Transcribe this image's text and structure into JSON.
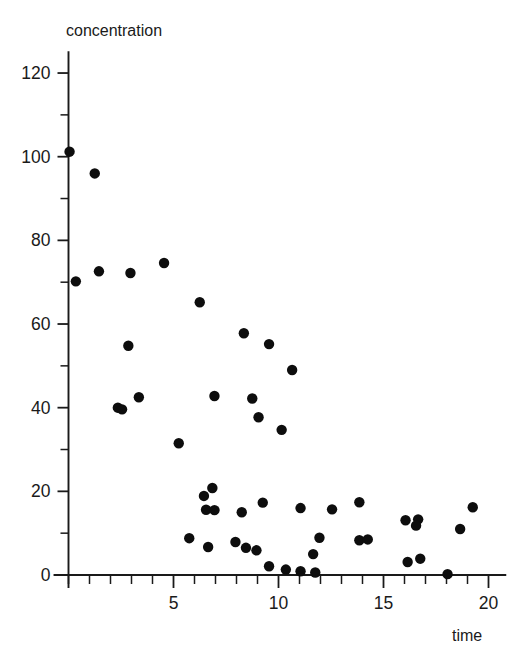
{
  "chart_data": {
    "type": "scatter",
    "title": "",
    "xlabel": "time",
    "ylabel": "concentration",
    "xlim": [
      0,
      20.8
    ],
    "ylim": [
      0,
      125
    ],
    "grid": false,
    "legend": null,
    "x_major_ticks": [
      5,
      10,
      15,
      20
    ],
    "x_major_tick_labels": [
      "5",
      "10",
      "15",
      "20"
    ],
    "x_minor_tick_step": 1,
    "y_major_ticks": [
      0,
      20,
      40,
      60,
      80,
      100,
      120
    ],
    "y_major_tick_labels": [
      "0",
      "20",
      "40",
      "60",
      "80",
      "100",
      "120"
    ],
    "y_minor_tick_step": 10,
    "marker_color": "#0d0d0d",
    "marker_shape": "circle",
    "marker_radius_px": 5.2,
    "points": [
      {
        "x": 0.05,
        "y": 101.2
      },
      {
        "x": 1.25,
        "y": 96.0
      },
      {
        "x": 0.35,
        "y": 70.2
      },
      {
        "x": 1.45,
        "y": 72.6
      },
      {
        "x": 2.95,
        "y": 72.2
      },
      {
        "x": 4.55,
        "y": 74.6
      },
      {
        "x": 6.25,
        "y": 65.2
      },
      {
        "x": 8.35,
        "y": 57.8
      },
      {
        "x": 9.55,
        "y": 55.2
      },
      {
        "x": 2.85,
        "y": 54.8
      },
      {
        "x": 10.65,
        "y": 49.0
      },
      {
        "x": 6.95,
        "y": 42.8
      },
      {
        "x": 8.75,
        "y": 42.2
      },
      {
        "x": 3.35,
        "y": 42.5
      },
      {
        "x": 2.35,
        "y": 40.0
      },
      {
        "x": 2.55,
        "y": 39.6
      },
      {
        "x": 9.05,
        "y": 37.7
      },
      {
        "x": 10.15,
        "y": 34.7
      },
      {
        "x": 5.25,
        "y": 31.5
      },
      {
        "x": 6.85,
        "y": 20.8
      },
      {
        "x": 6.45,
        "y": 18.9
      },
      {
        "x": 9.25,
        "y": 17.3
      },
      {
        "x": 13.85,
        "y": 17.4
      },
      {
        "x": 6.55,
        "y": 15.6
      },
      {
        "x": 6.95,
        "y": 15.5
      },
      {
        "x": 8.25,
        "y": 15.0
      },
      {
        "x": 11.05,
        "y": 16.0
      },
      {
        "x": 12.55,
        "y": 15.7
      },
      {
        "x": 19.25,
        "y": 16.2
      },
      {
        "x": 16.05,
        "y": 13.1
      },
      {
        "x": 16.65,
        "y": 13.3
      },
      {
        "x": 16.55,
        "y": 11.8
      },
      {
        "x": 18.65,
        "y": 11.0
      },
      {
        "x": 5.75,
        "y": 8.8
      },
      {
        "x": 11.95,
        "y": 8.9
      },
      {
        "x": 13.85,
        "y": 8.3
      },
      {
        "x": 14.25,
        "y": 8.5
      },
      {
        "x": 7.95,
        "y": 7.9
      },
      {
        "x": 6.65,
        "y": 6.7
      },
      {
        "x": 8.45,
        "y": 6.5
      },
      {
        "x": 8.95,
        "y": 5.9
      },
      {
        "x": 11.65,
        "y": 5.0
      },
      {
        "x": 16.15,
        "y": 3.1
      },
      {
        "x": 16.75,
        "y": 3.9
      },
      {
        "x": 9.55,
        "y": 2.1
      },
      {
        "x": 10.35,
        "y": 1.3
      },
      {
        "x": 11.05,
        "y": 0.9
      },
      {
        "x": 11.75,
        "y": 0.6
      },
      {
        "x": 18.05,
        "y": 0.2
      }
    ]
  },
  "labels": {
    "y_axis_title": "concentration",
    "x_axis_title": "time"
  }
}
